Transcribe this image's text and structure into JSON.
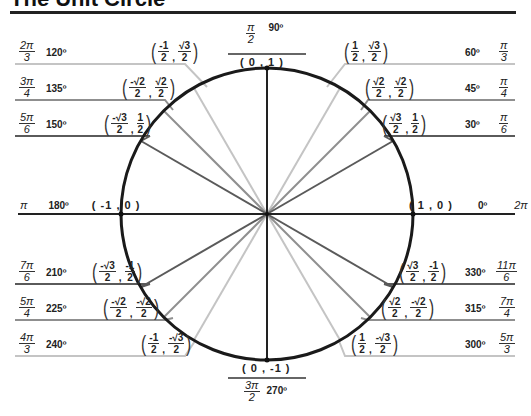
{
  "title": "The Unit Circle",
  "colors": {
    "circle": "#1a1a1a",
    "axes": "#222222",
    "dark_ray": "#555555",
    "mid_ray": "#8a8a8a",
    "light_ray": "#bdbdbd"
  },
  "angles": {
    "a0": {
      "deg": "0º",
      "rad_num": "2π",
      "rad_den": "",
      "coord": "( 1 , 0 )"
    },
    "a30": {
      "deg": "30º",
      "rad_num": "π",
      "rad_den": "6",
      "x_num": "√3",
      "x_den": "2",
      "y_num": "1",
      "y_den": "2"
    },
    "a45": {
      "deg": "45º",
      "rad_num": "π",
      "rad_den": "4",
      "x_num": "√2",
      "x_den": "2",
      "y_num": "√2",
      "y_den": "2"
    },
    "a60": {
      "deg": "60º",
      "rad_num": "π",
      "rad_den": "3",
      "x_num": "1",
      "x_den": "2",
      "y_num": "√3",
      "y_den": "2"
    },
    "a90": {
      "deg": "90º",
      "rad_num": "π",
      "rad_den": "2",
      "coord": "( 0 , 1 )"
    },
    "a120": {
      "deg": "120º",
      "rad_num": "2π",
      "rad_den": "3",
      "x_num": "-1",
      "x_den": "2",
      "y_num": "√3",
      "y_den": "2"
    },
    "a135": {
      "deg": "135º",
      "rad_num": "3π",
      "rad_den": "4",
      "x_num": "-√2",
      "x_den": "2",
      "y_num": "√2",
      "y_den": "2"
    },
    "a150": {
      "deg": "150º",
      "rad_num": "5π",
      "rad_den": "6",
      "x_num": "-√3",
      "x_den": "2",
      "y_num": "1",
      "y_den": "2"
    },
    "a180": {
      "deg": "180º",
      "rad_num": "π",
      "rad_den": "",
      "coord": "( -1 , 0 )"
    },
    "a210": {
      "deg": "210º",
      "rad_num": "7π",
      "rad_den": "6",
      "x_num": "-√3",
      "x_den": "2",
      "y_num": "-1",
      "y_den": "2"
    },
    "a225": {
      "deg": "225º",
      "rad_num": "5π",
      "rad_den": "4",
      "x_num": "-√2",
      "x_den": "2",
      "y_num": "-√2",
      "y_den": "2"
    },
    "a240": {
      "deg": "240º",
      "rad_num": "4π",
      "rad_den": "3",
      "x_num": "-1",
      "x_den": "2",
      "y_num": "-√3",
      "y_den": "2"
    },
    "a270": {
      "deg": "270º",
      "rad_num": "3π",
      "rad_den": "2",
      "coord": "( 0 , -1 )"
    },
    "a300": {
      "deg": "300º",
      "rad_num": "5π",
      "rad_den": "3",
      "x_num": "1",
      "x_den": "2",
      "y_num": "-√3",
      "y_den": "2"
    },
    "a315": {
      "deg": "315º",
      "rad_num": "7π",
      "rad_den": "4",
      "x_num": "√2",
      "x_den": "2",
      "y_num": "-√2",
      "y_den": "2"
    },
    "a330": {
      "deg": "330º",
      "rad_num": "11π",
      "rad_den": "6",
      "x_num": "√3",
      "x_den": "2",
      "y_num": "-1",
      "y_den": "2"
    }
  }
}
